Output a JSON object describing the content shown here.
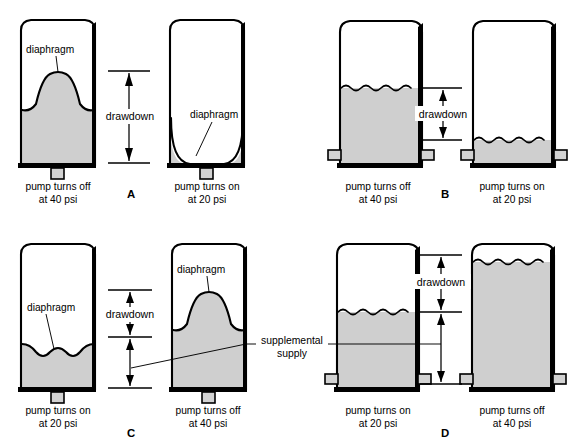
{
  "figure": {
    "background_color": "#ffffff",
    "ink_color": "#000000",
    "water_color": "#cfcfcf",
    "nozzle_color": "#d2d2d2"
  },
  "labels": {
    "diaphragm": "diaphragm",
    "drawdown": "drawdown",
    "supplemental_line1": "supplemental",
    "supplemental_line2": "supply",
    "pump_off_line1": "pump turns off",
    "pump_off_line2": "at 40 psi",
    "pump_on_line1": "pump turns on",
    "pump_on_line2": "at 20 psi"
  },
  "panels": [
    {
      "id": "A",
      "letter": "A",
      "tank_type": "diaphragm",
      "has_supplemental_supply": false,
      "outlet": "bottom",
      "left_tank": {
        "name": "panel-a-left-tank",
        "state": "pump turns off",
        "pressure_psi": 40,
        "caption_line1": "pump turns off",
        "caption_line2": "at 40 psi",
        "fill_level_pct": 62,
        "diaphragm_shape": "bell-high",
        "diaphragm_label": "diaphragm"
      },
      "right_tank": {
        "name": "panel-a-right-tank",
        "state": "pump turns on",
        "pressure_psi": 20,
        "caption_line1": "pump turns on",
        "caption_line2": "at 20 psi",
        "fill_level_pct": 6,
        "diaphragm_shape": "u-collapsed",
        "diaphragm_label": "diaphragm"
      },
      "dimension": {
        "name": "panel-a-drawdown",
        "label": "drawdown",
        "style": "double-arrow-full"
      }
    },
    {
      "id": "B",
      "letter": "B",
      "tank_type": "plain-water",
      "has_supplemental_supply": false,
      "outlet": "side",
      "left_tank": {
        "name": "panel-b-left-tank",
        "state": "pump turns off",
        "pressure_psi": 40,
        "caption_line1": "pump turns off",
        "caption_line2": "at 40 psi",
        "fill_level_pct": 60,
        "surface": "wavy"
      },
      "right_tank": {
        "name": "panel-b-right-tank",
        "state": "pump turns on",
        "pressure_psi": 20,
        "caption_line1": "pump turns on",
        "caption_line2": "at 20 psi",
        "fill_level_pct": 13,
        "surface": "wavy"
      },
      "dimension": {
        "name": "panel-b-drawdown",
        "label": "drawdown",
        "style": "double-arrow-full"
      }
    },
    {
      "id": "C",
      "letter": "C",
      "tank_type": "diaphragm",
      "has_supplemental_supply": true,
      "outlet": "bottom",
      "left_tank": {
        "name": "panel-c-left-tank",
        "state": "pump turns on",
        "pressure_psi": 20,
        "caption_line1": "pump turns on",
        "caption_line2": "at 20 psi",
        "fill_level_pct": 26,
        "diaphragm_shape": "wavy-low",
        "diaphragm_label": "diaphragm"
      },
      "right_tank": {
        "name": "panel-c-right-tank",
        "state": "pump turns off",
        "pressure_psi": 40,
        "caption_line1": "pump turns off",
        "caption_line2": "at 40 psi",
        "fill_level_pct": 62,
        "diaphragm_shape": "bell-high",
        "diaphragm_label": "diaphragm"
      },
      "dimension": {
        "name": "panel-c-drawdown",
        "label": "drawdown",
        "style": "split-arrow"
      },
      "supplemental_label_line1": "supplemental",
      "supplemental_label_line2": "supply"
    },
    {
      "id": "D",
      "letter": "D",
      "tank_type": "plain-water",
      "has_supplemental_supply": true,
      "outlet": "side",
      "left_tank": {
        "name": "panel-d-left-tank",
        "state": "pump turns on",
        "pressure_psi": 20,
        "caption_line1": "pump turns on",
        "caption_line2": "at 20 psi",
        "fill_level_pct": 52,
        "surface": "wavy"
      },
      "right_tank": {
        "name": "panel-d-right-tank",
        "state": "pump turns off",
        "pressure_psi": 40,
        "caption_line1": "pump turns off",
        "caption_line2": "at 40 psi",
        "fill_level_pct": 92,
        "surface": "wavy"
      },
      "dimension": {
        "name": "panel-d-drawdown",
        "label": "drawdown",
        "style": "split-arrow"
      },
      "supplemental_label_line1": "supplemental",
      "supplemental_label_line2": "supply"
    }
  ]
}
